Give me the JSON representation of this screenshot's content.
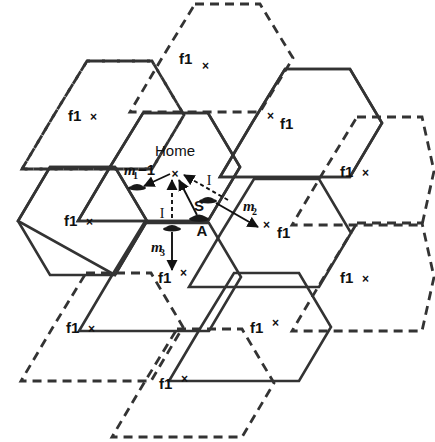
{
  "figure": {
    "type": "cellular-handoff-diagram",
    "title_label": "Home",
    "stroke_color": "#333333",
    "text_color": "#111111"
  },
  "cells": [
    {
      "id": "top",
      "label": "f1",
      "mark": "×",
      "mark_pos": "after-raised",
      "border": "dashed",
      "cx": 195,
      "cy": 58
    },
    {
      "id": "top-left",
      "label": "f1",
      "mark": "×",
      "mark_pos": "after",
      "border": "dashed",
      "cx": 87,
      "cy": 115
    },
    {
      "id": "top-right",
      "label": "f1",
      "mark": "×",
      "mark_pos": "before",
      "border": "solid",
      "cx": 285,
      "cy": 123
    },
    {
      "id": "right-upper",
      "label": "f1",
      "mark": "×",
      "mark_pos": "after",
      "border": "dashed",
      "cx": 357,
      "cy": 171
    },
    {
      "id": "home",
      "label": "Home",
      "mark": "×",
      "mark_pos": "none",
      "border": "solid",
      "cx": 175,
      "cy": 148
    },
    {
      "id": "left",
      "label": "f1",
      "mark": "×",
      "mark_pos": "after",
      "border": "solid",
      "cx": 83,
      "cy": 220
    },
    {
      "id": "right",
      "label": "f1",
      "mark": "×",
      "mark_pos": "after",
      "border": "solid",
      "cx": 287,
      "cy": 233
    },
    {
      "id": "right-lower",
      "label": "f1",
      "mark": "×",
      "mark_pos": "after",
      "border": "dashed",
      "cx": 357,
      "cy": 277
    },
    {
      "id": "bottom-center",
      "label": "f1",
      "mark": "×",
      "mark_pos": "after-raised",
      "border": "solid",
      "cx": 176,
      "cy": 277
    },
    {
      "id": "bottom-left",
      "label": "f1",
      "mark": "×",
      "mark_pos": "after",
      "border": "dashed",
      "cx": 86,
      "cy": 327
    },
    {
      "id": "bottom-right",
      "label": "f1",
      "mark": "×",
      "mark_pos": "after-raised",
      "border": "solid",
      "cx": 267,
      "cy": 327
    },
    {
      "id": "bottom",
      "label": "f1",
      "mark": "×",
      "mark_pos": "after-raised",
      "border": "dashed",
      "cx": 177,
      "cy": 383
    }
  ],
  "annotations": {
    "home_label": "Home",
    "m1_base": "m",
    "m1_sub": "1",
    "m1_suffix": "−1",
    "m2_base": "m",
    "m2_sub": "2",
    "m3_base": "m",
    "m3_sub": "3",
    "interference_left": "I",
    "interference_right": "I",
    "signal_label": "S",
    "mobile_label": "A"
  },
  "markers": {
    "base_station_mark": "×",
    "vehicle_icon": "vehicle-icon"
  }
}
